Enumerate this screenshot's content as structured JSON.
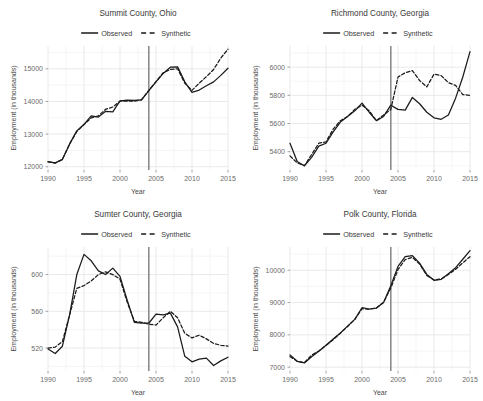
{
  "figure": {
    "layout": "2x2 small-multiples grid",
    "background": "#ffffff",
    "gridline_color": "#e6e6e6",
    "minor_gridline_color": "#f1f1f1",
    "line_color": "#1a1a1a",
    "intervention_line_color": "#8c8c8c"
  },
  "legend": {
    "observed_label": "Observed",
    "synthetic_label": "Synthetic",
    "position": "above plot, horizontal"
  },
  "axis": {
    "xlabel": "Year",
    "ylabel": "Employment (in thousands)",
    "xticks": [
      "1990",
      "1995",
      "2000",
      "2005",
      "2010",
      "2015"
    ]
  },
  "chart_data": [
    {
      "type": "line",
      "title": "Summit County, Ohio",
      "xlabel": "Year",
      "ylabel": "Employment (in thousands)",
      "xlim": [
        1990,
        2015
      ],
      "ylim": [
        11900,
        15700
      ],
      "yticks": [
        12000,
        13000,
        14000,
        15000
      ],
      "ytick_labels": [
        "12000",
        "13000",
        "14000",
        "15000"
      ],
      "xticks": [
        1990,
        1995,
        2000,
        2005,
        2010,
        2015
      ],
      "grid": true,
      "legend": [
        "Observed",
        "Synthetic"
      ],
      "annotations": [
        {
          "type": "vline",
          "x": 2004,
          "label": "intervention year"
        }
      ],
      "x": [
        1990,
        1991,
        1992,
        1993,
        1994,
        1995,
        1996,
        1997,
        1998,
        1999,
        2000,
        2001,
        2002,
        2003,
        2004,
        2005,
        2006,
        2007,
        2008,
        2009,
        2010,
        2011,
        2012,
        2013,
        2014,
        2015
      ],
      "series": [
        {
          "name": "Observed",
          "style": "solid",
          "values": [
            12160,
            12120,
            12220,
            12700,
            13100,
            13300,
            13560,
            13520,
            13700,
            13680,
            14020,
            14040,
            14030,
            14050,
            14330,
            14600,
            14860,
            15050,
            15060,
            14600,
            14280,
            14350,
            14480,
            14600,
            14800,
            15020
          ]
        },
        {
          "name": "Synthetic",
          "style": "dashed",
          "values": [
            12150,
            12110,
            12230,
            12690,
            13080,
            13290,
            13500,
            13560,
            13760,
            13830,
            14010,
            14010,
            14010,
            14060,
            14340,
            14610,
            14880,
            14980,
            15000,
            14560,
            14340,
            14560,
            14760,
            14980,
            15330,
            15600
          ]
        }
      ]
    },
    {
      "type": "line",
      "title": "Richmond County, Georgia",
      "xlabel": "Year",
      "ylabel": "Employment (in thousands)",
      "xlim": [
        1990,
        2015
      ],
      "ylim": [
        5270,
        6150
      ],
      "yticks": [
        5400,
        5600,
        5800,
        6000
      ],
      "ytick_labels": [
        "5400",
        "5600",
        "5800",
        "6000"
      ],
      "xticks": [
        1990,
        1995,
        2000,
        2005,
        2010,
        2015
      ],
      "grid": true,
      "legend": [
        "Observed",
        "Synthetic"
      ],
      "annotations": [
        {
          "type": "vline",
          "x": 2004,
          "label": "intervention year"
        }
      ],
      "x": [
        1990,
        1991,
        1992,
        1993,
        1994,
        1995,
        1996,
        1997,
        1998,
        1999,
        2000,
        2001,
        2002,
        2003,
        2004,
        2005,
        2006,
        2007,
        2008,
        2009,
        2010,
        2011,
        2012,
        2013,
        2014,
        2015
      ],
      "series": [
        {
          "name": "Observed",
          "style": "solid",
          "values": [
            5460,
            5330,
            5300,
            5360,
            5440,
            5460,
            5540,
            5610,
            5650,
            5690,
            5745,
            5680,
            5620,
            5650,
            5730,
            5700,
            5695,
            5785,
            5740,
            5680,
            5640,
            5630,
            5660,
            5780,
            5930,
            6110
          ]
        },
        {
          "name": "Synthetic",
          "style": "dashed",
          "values": [
            5370,
            5320,
            5300,
            5380,
            5460,
            5470,
            5560,
            5620,
            5650,
            5700,
            5730,
            5690,
            5620,
            5660,
            5700,
            5930,
            5960,
            5975,
            5905,
            5860,
            5950,
            5940,
            5890,
            5870,
            5805,
            5800
          ]
        }
      ]
    },
    {
      "type": "line",
      "title": "Sumter County, Georgia",
      "xlabel": "Year",
      "ylabel": "Employment (in thousands)",
      "xlim": [
        1990,
        2015
      ],
      "ylim": [
        495,
        630
      ],
      "yticks": [
        520,
        560,
        600
      ],
      "ytick_labels": [
        "520",
        "560",
        "600"
      ],
      "xticks": [
        1990,
        1995,
        2000,
        2005,
        2010,
        2015
      ],
      "grid": true,
      "legend": [
        "Observed",
        "Synthetic"
      ],
      "annotations": [
        {
          "type": "vline",
          "x": 2004,
          "label": "intervention year"
        }
      ],
      "x": [
        1990,
        1991,
        1992,
        1993,
        1994,
        1995,
        1996,
        1997,
        1998,
        1999,
        2000,
        2001,
        2002,
        2003,
        2004,
        2005,
        2006,
        2007,
        2008,
        2009,
        2010,
        2011,
        2012,
        2013,
        2014,
        2015
      ],
      "series": [
        {
          "name": "Observed",
          "style": "solid",
          "values": [
            519,
            514,
            522,
            556,
            600,
            622,
            615,
            604,
            600,
            607,
            598,
            572,
            548,
            547,
            547,
            557,
            556,
            558,
            543,
            511,
            505,
            508,
            509,
            501,
            506,
            510
          ]
        },
        {
          "name": "Synthetic",
          "style": "dashed",
          "values": [
            520,
            521,
            527,
            556,
            585,
            588,
            593,
            600,
            603,
            600,
            595,
            570,
            549,
            548,
            546,
            545,
            553,
            560,
            553,
            536,
            531,
            534,
            530,
            525,
            523,
            522
          ]
        }
      ]
    },
    {
      "type": "line",
      "title": "Polk County, Florida",
      "xlabel": "Year",
      "ylabel": "Employment (in thousands)",
      "xlim": [
        1990,
        2015
      ],
      "ylim": [
        6880,
        10720
      ],
      "yticks": [
        7000,
        8000,
        9000,
        10000
      ],
      "ytick_labels": [
        "7000",
        "8000",
        "9000",
        "10000"
      ],
      "xticks": [
        1990,
        1995,
        2000,
        2005,
        2010,
        2015
      ],
      "grid": true,
      "legend": [
        "Observed",
        "Synthetic"
      ],
      "annotations": [
        {
          "type": "vline",
          "x": 2004,
          "label": "intervention year"
        }
      ],
      "x": [
        1990,
        1991,
        1992,
        1993,
        1994,
        1995,
        1996,
        1997,
        1998,
        1999,
        2000,
        2001,
        2002,
        2003,
        2004,
        2005,
        2006,
        2007,
        2008,
        2009,
        2010,
        2011,
        2012,
        2013,
        2014,
        2015
      ],
      "series": [
        {
          "name": "Observed",
          "style": "solid",
          "values": [
            7380,
            7180,
            7130,
            7320,
            7490,
            7680,
            7870,
            8060,
            8270,
            8480,
            8840,
            8800,
            8830,
            9000,
            9520,
            10120,
            10420,
            10450,
            10220,
            9870,
            9690,
            9720,
            9890,
            10080,
            10340,
            10610
          ]
        },
        {
          "name": "Synthetic",
          "style": "dashed",
          "values": [
            7330,
            7180,
            7140,
            7370,
            7500,
            7670,
            7850,
            8050,
            8260,
            8480,
            8810,
            8790,
            8830,
            9010,
            9450,
            10020,
            10330,
            10400,
            10190,
            9840,
            9700,
            9730,
            9870,
            10030,
            10230,
            10420
          ]
        }
      ]
    }
  ]
}
